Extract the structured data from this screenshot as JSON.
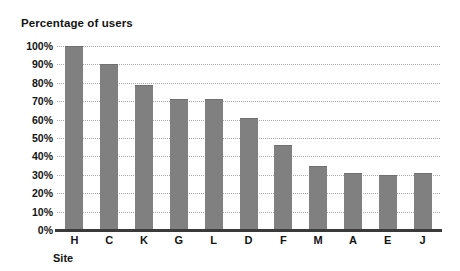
{
  "chart_data": {
    "type": "bar",
    "title": "Percentage of users",
    "xlabel": "Site",
    "ylabel": "",
    "categories": [
      "H",
      "C",
      "K",
      "G",
      "L",
      "D",
      "F",
      "M",
      "A",
      "E",
      "J"
    ],
    "values": [
      100,
      90,
      79,
      71,
      71,
      61,
      46,
      35,
      31,
      30,
      31
    ],
    "ylim": [
      0,
      100
    ],
    "ytick_labels": [
      "100%",
      "90%",
      "80%",
      "70%",
      "60%",
      "50%",
      "40%",
      "30%",
      "20%",
      "10%",
      "0%"
    ],
    "ytick_values": [
      100,
      90,
      80,
      70,
      60,
      50,
      40,
      30,
      20,
      10,
      0
    ],
    "grid": "horizontal-dotted",
    "legend": "none",
    "series": [
      {
        "name": "Percentage of users",
        "values": [
          100,
          90,
          79,
          71,
          71,
          61,
          46,
          35,
          31,
          30,
          31
        ]
      }
    ],
    "colors": {
      "bar": "#808080",
      "gridline": "#a8a8a8",
      "axis": "#3a3a3a",
      "text": "#141414",
      "background": "#ffffff"
    }
  }
}
